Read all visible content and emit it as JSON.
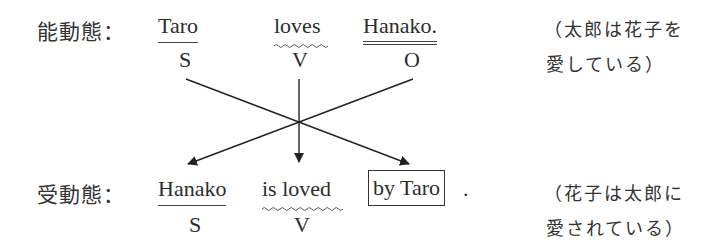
{
  "active": {
    "label": "能動態：",
    "subject": {
      "text": "Taro",
      "role": "S",
      "underline": "single"
    },
    "verb": {
      "text": "loves",
      "role": "V",
      "underline": "wavy"
    },
    "object": {
      "text": "Hanako.",
      "role": "O",
      "underline": "double"
    },
    "translation_line1": "（太郎は花子を",
    "translation_line2": "愛している）"
  },
  "passive": {
    "label": "受動態：",
    "subject": {
      "text": "Hanako",
      "role": "S",
      "underline": "single"
    },
    "verb": {
      "text": "is loved",
      "role": "V",
      "underline": "wavy"
    },
    "agent": {
      "text": "by Taro",
      "boxed": true
    },
    "period": ".",
    "translation_line1": "（花子は太郎に",
    "translation_line2": "愛されている）"
  },
  "arrows": [
    {
      "from": "active.subject (S)",
      "to": "passive.agent (by Taro)"
    },
    {
      "from": "active.verb (V)",
      "to": "passive.verb (is loved)"
    },
    {
      "from": "active.object (O)",
      "to": "passive.subject (Hanako)"
    }
  ],
  "colors": {
    "text": "#2d2d2d",
    "lines": "#222222",
    "background": "#ffffff"
  }
}
